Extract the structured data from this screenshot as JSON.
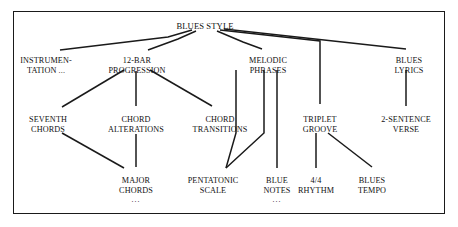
{
  "diagram": {
    "title": "BLUES STYLE",
    "type": "hierarchical-tree",
    "border_color": "#1a1a1a",
    "text_color": "#111111",
    "background": "#ffffff",
    "nodes": [
      {
        "id": "blues-style",
        "label_lines": [
          "BLUES STYLE"
        ],
        "x": 205,
        "y": 22,
        "level": 0
      },
      {
        "id": "instrumentation",
        "label_lines": [
          "INSTRUMEN-",
          "TATION ..."
        ],
        "x": 46,
        "y": 56,
        "level": 1
      },
      {
        "id": "12-bar-progression",
        "label_lines": [
          "12-BAR",
          "PROGRESSION"
        ],
        "x": 137,
        "y": 56,
        "level": 1
      },
      {
        "id": "melodic-phrases",
        "label_lines": [
          "MELODIC",
          "PHRASES"
        ],
        "x": 268,
        "y": 56,
        "level": 1
      },
      {
        "id": "blues-lyrics",
        "label_lines": [
          "BLUES",
          "LYRICS"
        ],
        "x": 409,
        "y": 56,
        "level": 1
      },
      {
        "id": "seventh-chords",
        "label_lines": [
          "SEVENTH",
          "CHORDS"
        ],
        "x": 48,
        "y": 115,
        "level": 2
      },
      {
        "id": "chord-alterations",
        "label_lines": [
          "CHORD",
          "ALTERATIONS"
        ],
        "x": 136,
        "y": 115,
        "level": 2
      },
      {
        "id": "chord-transitions",
        "label_lines": [
          "CHORD",
          "TRANSITIONS"
        ],
        "x": 220,
        "y": 115,
        "level": 2
      },
      {
        "id": "triplet-groove",
        "label_lines": [
          "TRIPLET",
          "GROOVE"
        ],
        "x": 320,
        "y": 115,
        "level": 2
      },
      {
        "id": "2-sentence-verse",
        "label_lines": [
          "2-SENTENCE",
          "VERSE"
        ],
        "x": 406,
        "y": 115,
        "level": 2
      },
      {
        "id": "major-chords",
        "label_lines": [
          "MAJOR",
          "CHORDS",
          "..."
        ],
        "x": 136,
        "y": 176,
        "level": 3
      },
      {
        "id": "pentatonic-scale",
        "label_lines": [
          "PENTATONIC",
          "SCALE"
        ],
        "x": 213,
        "y": 176,
        "level": 3
      },
      {
        "id": "blue-notes",
        "label_lines": [
          "BLUE",
          "NOTES",
          "..."
        ],
        "x": 277,
        "y": 176,
        "level": 3
      },
      {
        "id": "4-4-rhythm",
        "label_lines": [
          "4/4",
          "RHYTHM"
        ],
        "x": 316,
        "y": 176,
        "level": 3
      },
      {
        "id": "blues-tempo",
        "label_lines": [
          "BLUES",
          "TEMPO"
        ],
        "x": 372,
        "y": 176,
        "level": 3
      }
    ],
    "edges": [
      {
        "from": "blues-style",
        "to": "instrumentation",
        "points": "192,30 168,37 60,50"
      },
      {
        "from": "blues-style",
        "to": "12-bar-progression",
        "points": "196,31 178,39 148,50"
      },
      {
        "from": "blues-style",
        "to": "melodic-phrases",
        "points": "217,31 243,42 262,49"
      },
      {
        "from": "blues-style",
        "to": "triplet-groove",
        "points": "220,30 320,41 320,104"
      },
      {
        "from": "blues-style",
        "to": "blues-lyrics",
        "points": "224,29 406,49"
      },
      {
        "from": "12-bar-progression",
        "to": "seventh-chords",
        "points": "124,70 62,107"
      },
      {
        "from": "12-bar-progression",
        "to": "chord-alterations",
        "points": "136,71 136,106"
      },
      {
        "from": "12-bar-progression",
        "to": "chord-transitions",
        "points": "150,70 212,106"
      },
      {
        "from": "seventh-chords",
        "to": "major-chords",
        "points": "62,133 124,168"
      },
      {
        "from": "chord-alterations",
        "to": "major-chords",
        "points": "136,134 136,167"
      },
      {
        "from": "melodic-phrases",
        "to": "pentatonic-scale",
        "points": "264,70 264,133 226,168"
      },
      {
        "from": "melodic-phrases",
        "to": "blue-notes",
        "points": "277,70 277,168"
      },
      {
        "from": "chord-transitions",
        "to": "pentatonic-scale",
        "points": "236,70 236,133 226,168"
      },
      {
        "from": "triplet-groove",
        "to": "4-4-rhythm",
        "points": "316,133 316,168"
      },
      {
        "from": "triplet-groove",
        "to": "blues-tempo",
        "points": "328,133 372,167"
      },
      {
        "from": "blues-lyrics",
        "to": "2-sentence-verse",
        "points": "406,70 406,106"
      }
    ]
  }
}
